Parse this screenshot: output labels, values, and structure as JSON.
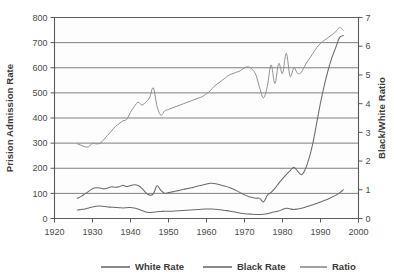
{
  "chart_data": {
    "type": "line",
    "title": "",
    "xlabel": "",
    "ylabel": "Prision Admission Rate",
    "y2label": "Black/White Ratio",
    "xlim": [
      1920,
      2000
    ],
    "ylim": [
      0,
      800
    ],
    "y2lim": [
      0,
      7
    ],
    "grid": true,
    "legend_position": "bottom",
    "xticks": [
      1920,
      1930,
      1940,
      1950,
      1960,
      1970,
      1980,
      1990,
      2000
    ],
    "yticks": [
      0,
      100,
      200,
      300,
      400,
      500,
      600,
      700,
      800
    ],
    "y2ticks": [
      0,
      1,
      2,
      3,
      4,
      5,
      6,
      7
    ],
    "series": [
      {
        "name": "White Rate",
        "axis": "left",
        "color": "#6b6b6b",
        "x": [
          1926,
          1927,
          1928,
          1929,
          1930,
          1931,
          1932,
          1933,
          1934,
          1935,
          1936,
          1937,
          1938,
          1939,
          1940,
          1941,
          1942,
          1943,
          1944,
          1945,
          1946,
          1947,
          1948,
          1949,
          1950,
          1951,
          1952,
          1953,
          1954,
          1955,
          1956,
          1957,
          1958,
          1959,
          1960,
          1961,
          1962,
          1963,
          1964,
          1965,
          1966,
          1967,
          1968,
          1969,
          1970,
          1971,
          1972,
          1973,
          1974,
          1975,
          1976,
          1977,
          1978,
          1979,
          1980,
          1981,
          1982,
          1983,
          1984,
          1985,
          1986,
          1987,
          1988,
          1989,
          1990,
          1991,
          1992,
          1993,
          1994,
          1995,
          1996
        ],
        "values": [
          34,
          36,
          38,
          42,
          46,
          49,
          50,
          48,
          46,
          45,
          44,
          43,
          42,
          43,
          44,
          42,
          38,
          32,
          26,
          24,
          25,
          27,
          28,
          29,
          29,
          29,
          30,
          31,
          32,
          33,
          34,
          35,
          36,
          37,
          38,
          38,
          37,
          36,
          34,
          32,
          30,
          27,
          24,
          21,
          19,
          18,
          17,
          16,
          16,
          17,
          19,
          23,
          27,
          30,
          36,
          41,
          38,
          36,
          38,
          41,
          45,
          50,
          55,
          60,
          66,
          72,
          78,
          85,
          92,
          102,
          114
        ]
      },
      {
        "name": "Black Rate",
        "axis": "left",
        "color": "#6b6b6b",
        "x": [
          1926,
          1927,
          1928,
          1929,
          1930,
          1931,
          1932,
          1933,
          1934,
          1935,
          1936,
          1937,
          1938,
          1939,
          1940,
          1941,
          1942,
          1943,
          1944,
          1945,
          1946,
          1947,
          1948,
          1949,
          1950,
          1951,
          1952,
          1953,
          1954,
          1955,
          1956,
          1957,
          1958,
          1959,
          1960,
          1961,
          1962,
          1963,
          1964,
          1965,
          1966,
          1967,
          1968,
          1969,
          1970,
          1971,
          1972,
          1973,
          1974,
          1975,
          1976,
          1977,
          1978,
          1979,
          1980,
          1981,
          1982,
          1983,
          1984,
          1985,
          1986,
          1987,
          1988,
          1989,
          1990,
          1991,
          1992,
          1993,
          1994,
          1995,
          1996
        ],
        "values": [
          80,
          88,
          98,
          108,
          118,
          122,
          121,
          118,
          121,
          126,
          124,
          126,
          132,
          127,
          131,
          134,
          131,
          120,
          103,
          93,
          98,
          130,
          112,
          100,
          103,
          106,
          109,
          112,
          116,
          119,
          122,
          126,
          130,
          133,
          137,
          140,
          139,
          136,
          132,
          128,
          123,
          117,
          110,
          102,
          94,
          88,
          84,
          81,
          80,
          66,
          92,
          104,
          120,
          140,
          158,
          175,
          190,
          204,
          188,
          174,
          196,
          240,
          300,
          380,
          460,
          530,
          590,
          640,
          680,
          720,
          728
        ]
      },
      {
        "name": "Ratio",
        "axis": "right",
        "color": "#8a8a8a",
        "x": [
          1926,
          1927,
          1928,
          1929,
          1930,
          1931,
          1932,
          1933,
          1934,
          1935,
          1936,
          1937,
          1938,
          1939,
          1940,
          1941,
          1942,
          1943,
          1944,
          1945,
          1946,
          1947,
          1948,
          1949,
          1950,
          1951,
          1952,
          1953,
          1954,
          1955,
          1956,
          1957,
          1958,
          1959,
          1960,
          1961,
          1962,
          1963,
          1964,
          1965,
          1966,
          1967,
          1968,
          1969,
          1970,
          1971,
          1972,
          1973,
          1974,
          1975,
          1976,
          1977,
          1978,
          1979,
          1980,
          1981,
          1982,
          1983,
          1984,
          1985,
          1986,
          1987,
          1988,
          1989,
          1990,
          1991,
          1992,
          1993,
          1994,
          1995,
          1996
        ],
        "values": [
          2.6,
          2.55,
          2.5,
          2.5,
          2.62,
          2.6,
          2.62,
          2.75,
          2.9,
          3.05,
          3.2,
          3.3,
          3.4,
          3.45,
          3.7,
          3.9,
          4.05,
          3.95,
          4.05,
          4.2,
          4.55,
          3.9,
          3.6,
          3.75,
          3.8,
          3.85,
          3.9,
          3.95,
          4.0,
          4.05,
          4.1,
          4.15,
          4.2,
          4.25,
          4.35,
          4.45,
          4.6,
          4.7,
          4.8,
          4.9,
          5.0,
          5.05,
          5.1,
          5.15,
          5.25,
          5.28,
          5.2,
          5.0,
          4.55,
          4.2,
          4.6,
          5.35,
          4.7,
          5.4,
          5.05,
          5.75,
          4.95,
          5.25,
          5.05,
          5.1,
          5.35,
          5.55,
          5.75,
          5.95,
          6.1,
          6.2,
          6.3,
          6.4,
          6.5,
          6.65,
          6.55
        ]
      }
    ]
  },
  "legend": {
    "items": [
      {
        "label": "White Rate"
      },
      {
        "label": "Black Rate"
      },
      {
        "label": "Ratio"
      }
    ]
  }
}
